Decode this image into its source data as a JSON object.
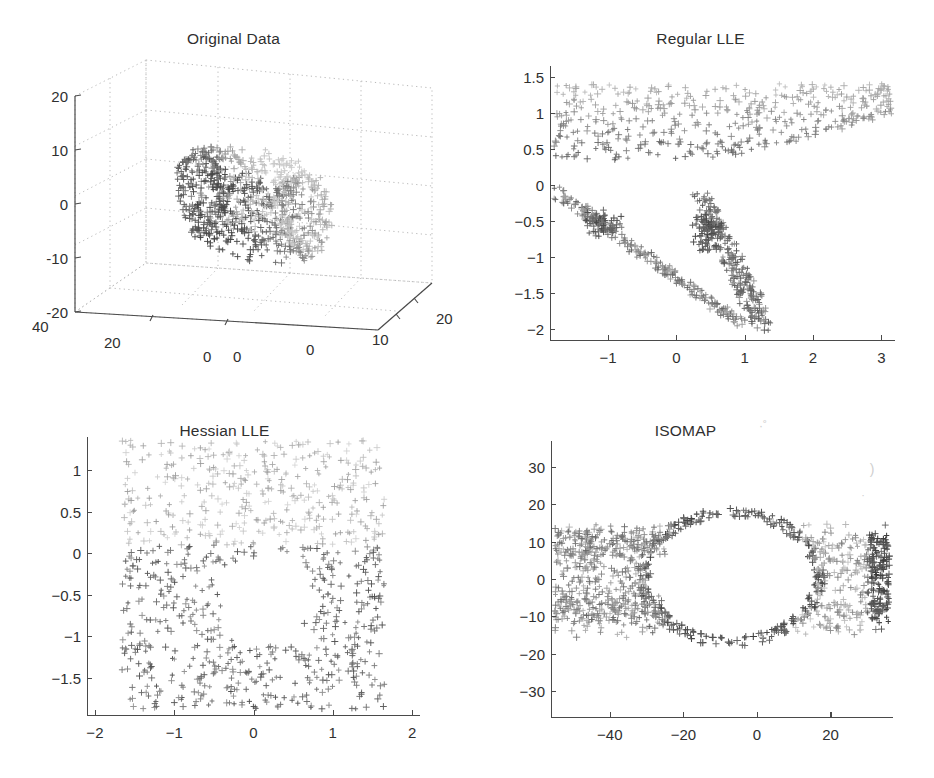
{
  "figure": {
    "background": "#ffffff",
    "marker": "plus",
    "marker_palette": [
      "#9a9a9a",
      "#7d7d7d",
      "#5e5e5e",
      "#454545",
      "#b4b4b4",
      "#cccccc"
    ],
    "axis_color": "#4a4a4a",
    "text_color": "#2f2f2f"
  },
  "panels": [
    {
      "id": "original",
      "title": "Original Data",
      "artifact_note": ""
    },
    {
      "id": "regular",
      "title": "Regular LLE",
      "artifact_note": ""
    },
    {
      "id": "hessian",
      "title": "Hessian LLE",
      "artifact_note": ""
    },
    {
      "id": "isomap",
      "title": "ISOMAP",
      "artifact_note": "·˚"
    }
  ],
  "chart_data": [
    {
      "type": "scatter",
      "id": "original",
      "title": "Original Data",
      "projection": "3d",
      "xlabel": "",
      "ylabel": "",
      "zlabel": "",
      "xticks": [
        0,
        10,
        20
      ],
      "xticklabels": [
        "0",
        "10",
        "20"
      ],
      "yticks": [
        -10,
        0,
        10,
        20,
        40
      ],
      "yticklabels": [
        "-10",
        "0",
        "10",
        "20",
        "40"
      ],
      "zticks": [
        -20,
        -10,
        0,
        10,
        20
      ],
      "zticklabels": [
        "-20",
        "-10",
        "0",
        "10",
        "20"
      ],
      "xlim": [
        -10,
        20
      ],
      "ylim": [
        0,
        40
      ],
      "zlim": [
        -20,
        20
      ],
      "grid": true,
      "legend": "none",
      "n_points": 900,
      "shape": "torus-band",
      "description": "3-D scatter of a toroidal / swiss-roll band of grey plus markers viewed obliquely, drawn inside a dotted 3-D grid box.",
      "points": [
        {
          "x": -8.0,
          "y": 4.0,
          "z": 9.8,
          "c": "#6b6b6b"
        },
        {
          "x": -6.0,
          "y": 6.0,
          "z": 10.2,
          "c": "#5e5e5e"
        },
        {
          "x": -4.0,
          "y": 8.0,
          "z": 10.4,
          "c": "#555555"
        },
        {
          "x": -1.0,
          "y": 10.0,
          "z": 9.6,
          "c": "#4d4d4d"
        },
        {
          "x": 2.0,
          "y": 12.0,
          "z": 8.2,
          "c": "#4a4a4a"
        },
        {
          "x": 5.0,
          "y": 14.0,
          "z": 6.0,
          "c": "#4f4f4f"
        },
        {
          "x": 8.0,
          "y": 16.0,
          "z": 3.0,
          "c": "#585858"
        },
        {
          "x": 10.0,
          "y": 18.0,
          "z": 0.0,
          "c": "#606060"
        },
        {
          "x": 11.0,
          "y": 20.0,
          "z": -4.0,
          "c": "#6a6a6a"
        },
        {
          "x": 10.0,
          "y": 22.0,
          "z": -8.0,
          "c": "#747474"
        },
        {
          "x": 7.0,
          "y": 24.0,
          "z": -12.0,
          "c": "#7e7e7e"
        },
        {
          "x": 3.0,
          "y": 26.0,
          "z": -15.0,
          "c": "#888888"
        },
        {
          "x": -1.0,
          "y": 28.0,
          "z": -16.0,
          "c": "#929292"
        },
        {
          "x": -5.0,
          "y": 30.0,
          "z": -15.0,
          "c": "#9c9c9c"
        },
        {
          "x": -8.0,
          "y": 32.0,
          "z": -12.0,
          "c": "#a6a6a6"
        },
        {
          "x": -9.5,
          "y": 34.0,
          "z": -7.0,
          "c": "#b0b0b0"
        },
        {
          "x": -9.0,
          "y": 36.0,
          "z": -2.0,
          "c": "#bababa"
        },
        {
          "x": -6.5,
          "y": 38.0,
          "z": 3.0,
          "c": "#c4c4c4"
        }
      ]
    },
    {
      "type": "scatter",
      "id": "regular",
      "title": "Regular LLE",
      "projection": "2d",
      "xlabel": "",
      "ylabel": "",
      "xticks": [
        -1,
        0,
        1,
        2,
        3
      ],
      "xticklabels": [
        "-1",
        "0",
        "1",
        "2",
        "3"
      ],
      "yticks": [
        -2,
        -1.5,
        -1,
        -0.5,
        0,
        0.5,
        1,
        1.5
      ],
      "yticklabels": [
        "-2",
        "-1.5",
        "-1",
        "-0.5",
        "0",
        "0.5",
        "1",
        "1.5"
      ],
      "xlim": [
        -1.85,
        3.2
      ],
      "ylim": [
        -2.15,
        1.65
      ],
      "grid": false,
      "legend": "none",
      "n_points": 900,
      "shape": "collapsed-fan",
      "description": "Dense light band across the top between y=0.3 and y=1.45 spanning the full x-range, plus a darker V/fan shaped arm descending from (0.4,-0.2) to (1.3,-1.95) and a second arm from (-1.7,-0.1) to (0.9,-1.9). Large empty wedge between the two arms centred near (-0.3,-0.9)."
    },
    {
      "type": "scatter",
      "id": "hessian",
      "title": "Hessian LLE",
      "projection": "2d",
      "xlabel": "",
      "ylabel": "",
      "xticks": [
        -2,
        -1,
        0,
        1,
        2
      ],
      "xticklabels": [
        "-2",
        "-1",
        "0",
        "1",
        "2"
      ],
      "yticks": [
        -1.5,
        -1,
        -0.5,
        0,
        0.5,
        1
      ],
      "yticklabels": [
        "-1.5",
        "-1",
        "-0.5",
        "0",
        "0.5",
        "1"
      ],
      "xlim": [
        -2.1,
        2.1
      ],
      "ylim": [
        -1.95,
        1.4
      ],
      "grid": false,
      "legend": "none",
      "n_points": 900,
      "shape": "rectangle-with-hole",
      "description": "Near-uniform rectangular point cloud from x=-1.65 to 1.65 and y=-1.85 to 1.35, with a clear elliptical hole centred at about (0.15,-0.55) of radius 0.55 x 0.5. Upper half points are lighter grey, lower half darker."
    },
    {
      "type": "scatter",
      "id": "isomap",
      "title": "ISOMAP",
      "projection": "2d",
      "xlabel": "",
      "ylabel": "",
      "xticks": [
        -40,
        -20,
        0,
        20
      ],
      "xticklabels": [
        "-40",
        "-20",
        "0",
        "20"
      ],
      "yticks": [
        -30,
        -20,
        -10,
        0,
        10,
        20,
        30
      ],
      "yticklabels": [
        "-30",
        "-20",
        "-10",
        "0",
        "10",
        "20",
        "30"
      ],
      "xlim": [
        -56,
        37
      ],
      "ylim": [
        -37,
        37
      ],
      "grid": false,
      "legend": "none",
      "n_points": 900,
      "shape": "annulus-with-tails",
      "description": "A large empty elliptical hole centred near (-7, 0) with semi-axes 22 x 16, ringed by dark plus markers. Point bands extend left to x=-55 and right to x=36 in horizontal streaks between y=-12 and y=12; densest dark column at the far right edge near x=34."
    }
  ]
}
